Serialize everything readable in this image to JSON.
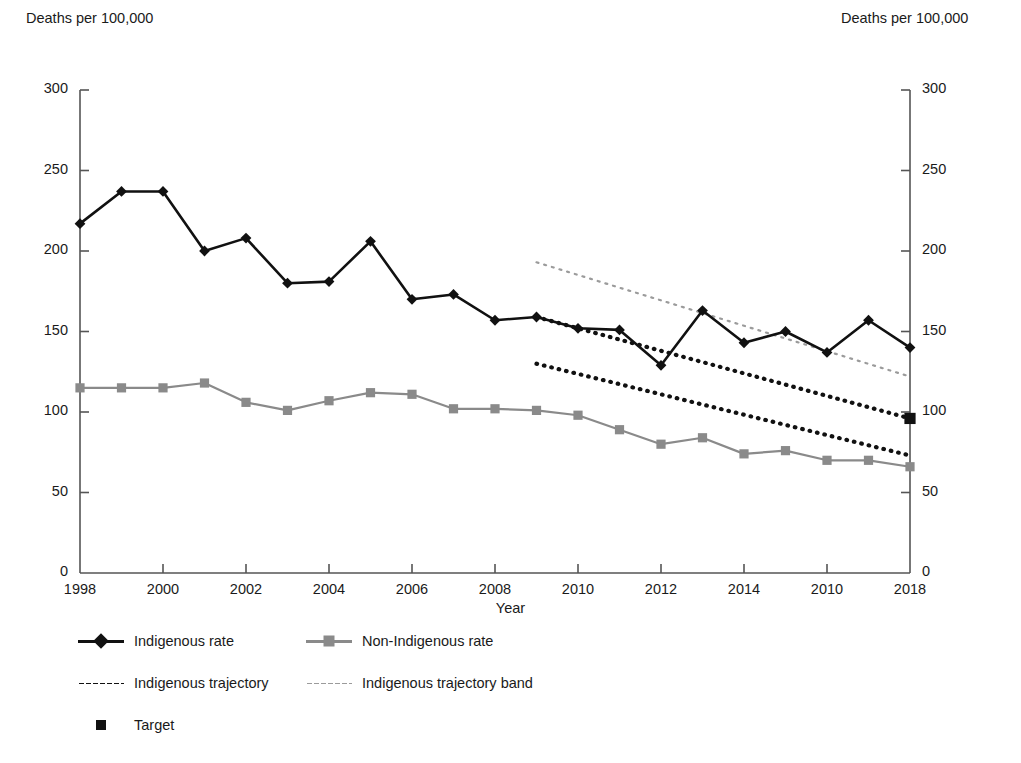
{
  "chart_data": {
    "type": "line",
    "title": "",
    "xlabel": "Year",
    "ylabel": "Deaths per 100,000",
    "ylabel_right": "Deaths per 100,000",
    "xlim": [
      1998,
      2018
    ],
    "ylim": [
      0,
      300
    ],
    "yticks": [
      0,
      50,
      100,
      150,
      200,
      250,
      300
    ],
    "ytick_labels": [
      "0",
      "50",
      "100",
      "150",
      "200",
      "250",
      "300"
    ],
    "xticks": [
      1998,
      2000,
      2002,
      2004,
      2006,
      2008,
      2010,
      2012,
      2014,
      2016,
      2018
    ],
    "xtick_labels": [
      "1998",
      "2000",
      "2002",
      "2004",
      "2006",
      "2008",
      "2010",
      "2012",
      "2014",
      "2010",
      "2018"
    ],
    "grid": false,
    "legend_position": "below",
    "x": [
      1998,
      1999,
      2000,
      2001,
      2002,
      2003,
      2004,
      2005,
      2006,
      2007,
      2008,
      2009,
      2010,
      2011,
      2012,
      2013,
      2014,
      2015,
      2016,
      2017,
      2018
    ],
    "series": [
      {
        "name": "Indigenous rate",
        "marker": "diamond",
        "color": "#111111",
        "style": "solid",
        "values": [
          217,
          237,
          237,
          200,
          208,
          180,
          181,
          206,
          170,
          173,
          157,
          159,
          152,
          151,
          129,
          163,
          143,
          150,
          137,
          157,
          140
        ]
      },
      {
        "name": "Non-Indigenous rate",
        "marker": "square",
        "color": "#8a8a8a",
        "style": "solid",
        "values": [
          115,
          115,
          115,
          118,
          106,
          101,
          107,
          112,
          111,
          102,
          102,
          101,
          98,
          89,
          80,
          84,
          74,
          76,
          70,
          70,
          66
        ]
      }
    ],
    "trajectories": [
      {
        "name": "Indigenous trajectory",
        "color": "#111111",
        "style": "dotted",
        "x": [
          2009,
          2018
        ],
        "values": [
          159,
          96
        ]
      },
      {
        "name": "Indigenous trajectory lower",
        "color": "#111111",
        "style": "dotted",
        "x": [
          2009,
          2018
        ],
        "values": [
          130,
          73
        ]
      },
      {
        "name": "Indigenous trajectory band",
        "color": "#9b9b9b",
        "style": "dotted",
        "x": [
          2009,
          2018
        ],
        "values": [
          193,
          122
        ]
      }
    ],
    "target": {
      "name": "Target",
      "marker": "square",
      "color": "#111111",
      "x": 2018,
      "value": 96
    }
  },
  "legend": {
    "items": [
      {
        "label": "Indigenous rate",
        "kind": "line-diamond",
        "color": "#111111"
      },
      {
        "label": "Non-Indigenous rate",
        "kind": "line-square",
        "color": "#8a8a8a"
      },
      {
        "label": "Indigenous trajectory",
        "kind": "dotted-dark",
        "color": "#111111"
      },
      {
        "label": "Indigenous trajectory band",
        "kind": "dotted-light",
        "color": "#9b9b9b"
      },
      {
        "label": "Target",
        "kind": "square-only",
        "color": "#111111"
      }
    ]
  }
}
